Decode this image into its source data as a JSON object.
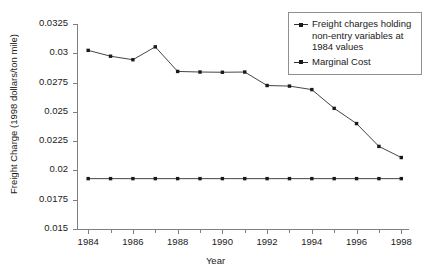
{
  "chart_data": {
    "type": "line",
    "title": "",
    "xlabel": "Year",
    "ylabel": "Freight Charge (1998 dollars/ton mile)",
    "xlim": [
      1983.5,
      1998.3
    ],
    "ylim": [
      0.015,
      0.0325
    ],
    "grid": false,
    "legend_position": "top-right",
    "x_tick_labels": [
      "1984",
      "1986",
      "1988",
      "1990",
      "1992",
      "1994",
      "1996",
      "1998"
    ],
    "x_tick_values": [
      1984,
      1986,
      1988,
      1990,
      1992,
      1994,
      1996,
      1998
    ],
    "x_minor_ticks": [
      1985,
      1987,
      1989,
      1991,
      1993,
      1995,
      1997
    ],
    "y_tick_labels": [
      "0.0325",
      "0.03",
      "0.0275",
      "0.025",
      "0.0225",
      "0.02",
      "0.0175",
      "0.015"
    ],
    "y_tick_values": [
      0.0325,
      0.03,
      0.0275,
      0.025,
      0.0225,
      0.02,
      0.0175,
      0.015
    ],
    "x": [
      1984,
      1985,
      1986,
      1987,
      1988,
      1989,
      1990,
      1991,
      1992,
      1993,
      1994,
      1995,
      1996,
      1997,
      1998
    ],
    "series": [
      {
        "name": "Freight charges holding non-entry variables at 1984 values",
        "values": [
          0.03025,
          0.02975,
          0.02945,
          0.03055,
          0.02845,
          0.0284,
          0.02838,
          0.0284,
          0.02725,
          0.0272,
          0.0269,
          0.0253,
          0.024,
          0.02205,
          0.0211
        ]
      },
      {
        "name": "Marginal Cost",
        "values": [
          0.0193,
          0.0193,
          0.0193,
          0.0193,
          0.0193,
          0.0193,
          0.0193,
          0.0193,
          0.0193,
          0.0193,
          0.0193,
          0.0193,
          0.0193,
          0.0193,
          0.0193
        ]
      }
    ]
  },
  "legend": {
    "items": [
      {
        "label": "Freight charges holding non-entry variables at 1984 values"
      },
      {
        "label": "Marginal Cost"
      }
    ]
  },
  "colors": {
    "line": "#303030",
    "marker": "#1a1a1a",
    "axis": "#808080",
    "text": "#1a1a1a",
    "background": "#ffffff"
  }
}
